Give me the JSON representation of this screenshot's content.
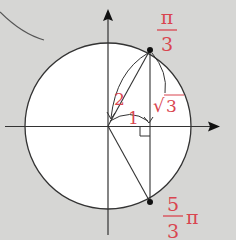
{
  "diagram": {
    "type": "unit-circle",
    "colors": {
      "background": "#d6d6d4",
      "circle_fill": "#ffffff",
      "line": "#333333",
      "label": "#d9454f"
    },
    "labels": {
      "angle_top": {
        "numerator": "π",
        "denominator": "3"
      },
      "angle_bottom": {
        "numerator": "5",
        "denominator": "3",
        "suffix": "π"
      },
      "hypotenuse": "2",
      "base": "1",
      "height_sqrt": "√",
      "height_value": "3"
    }
  }
}
